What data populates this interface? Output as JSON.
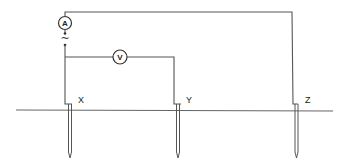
{
  "diagram": {
    "type": "earth-resistance-test-circuit",
    "ammeter": {
      "label": "A"
    },
    "voltmeter": {
      "label": "V"
    },
    "source": {
      "symbol": "~"
    },
    "electrodes": [
      {
        "label": "X"
      },
      {
        "label": "Y"
      },
      {
        "label": "Z"
      }
    ],
    "colors": {
      "line": "#555555",
      "background": "#ffffff"
    }
  }
}
